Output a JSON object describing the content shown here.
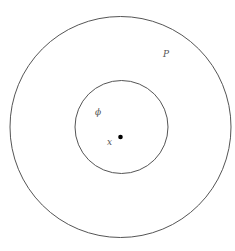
{
  "diagram": {
    "outer_region": {
      "label": "P"
    },
    "inner_region": {
      "label": "ϕ"
    },
    "point": {
      "label": "x"
    },
    "colors": {
      "stroke": "#555555",
      "point": "#000000",
      "label": "#555555",
      "background": "#ffffff"
    }
  }
}
